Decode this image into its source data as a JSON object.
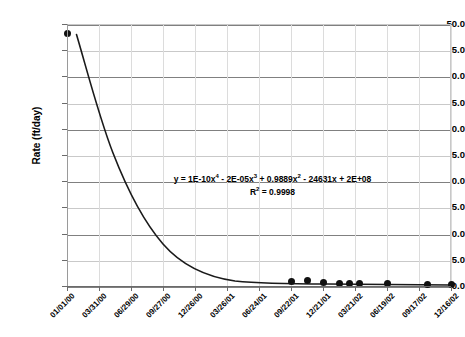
{
  "chart_data": {
    "type": "scatter",
    "title": "",
    "xlabel": "",
    "ylabel": "Rate (ft/day)",
    "ylim": [
      0.0,
      50.0
    ],
    "ytick_labels": [
      "50.0",
      "45.0",
      "40.0",
      "35.0",
      "30.0",
      "25.0",
      "20.0",
      "15.0",
      "10.0",
      "5.0",
      "0.0"
    ],
    "ytick_values": [
      50.0,
      45.0,
      40.0,
      35.0,
      30.0,
      25.0,
      20.0,
      15.0,
      10.0,
      5.0,
      0.0
    ],
    "xtick_labels": [
      "01/01/00",
      "03/31/00",
      "06/29/00",
      "09/27/00",
      "12/26/00",
      "03/26/01",
      "06/24/01",
      "09/22/01",
      "12/21/01",
      "03/21/02",
      "06/19/02",
      "09/17/02",
      "12/16/02"
    ],
    "grid": "horizontal-and-vertical",
    "legend": "none",
    "marker_style": "filled-circle",
    "trendline": "polynomial-order-4",
    "points": [
      {
        "x": "01/01/00",
        "y": 48.3
      },
      {
        "x": "09/22/01",
        "y": 1.1
      },
      {
        "x": "11/06/01",
        "y": 1.3
      },
      {
        "x": "12/21/01",
        "y": 0.9
      },
      {
        "x": "02/05/02",
        "y": 0.6
      },
      {
        "x": "03/05/02",
        "y": 0.7
      },
      {
        "x": "04/05/02",
        "y": 0.6
      },
      {
        "x": "06/19/02",
        "y": 0.6
      },
      {
        "x": "10/10/02",
        "y": 0.4
      },
      {
        "x": "12/16/02",
        "y": 0.4
      }
    ],
    "annotations": {
      "equation_prefix": "y = 1E-10x",
      "equation_exp1": "4",
      "equation_mid1": " - 2E-05x",
      "equation_exp2": "3",
      "equation_mid2": " + 0.9889x",
      "equation_exp3": "2",
      "equation_tail": " - 24631x + 2E+08",
      "r_squared_label": "R",
      "r_squared_exp": "2",
      "r_squared_value": " = 0.9998"
    },
    "colors": {
      "marker": "#111111",
      "trendline": "#1a1a1a",
      "gridline_major": "#808080",
      "gridline_minor": "#c9c9c9",
      "axis": "#6b6b6b",
      "background": "#ffffff"
    }
  }
}
